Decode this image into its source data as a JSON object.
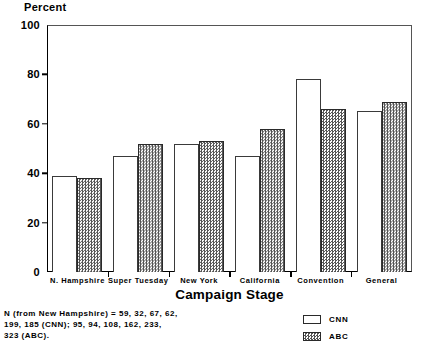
{
  "chart_data": {
    "type": "bar",
    "title": "",
    "ylabel": "Percent",
    "xlabel": "Campaign Stage",
    "ylim": [
      0,
      100
    ],
    "yticks": [
      0,
      20,
      40,
      60,
      80,
      100
    ],
    "grid": false,
    "legend_position": "bottom-right",
    "categories": [
      "N. Hampshire",
      "Super Tuesday",
      "New York",
      "California",
      "Convention",
      "General"
    ],
    "series": [
      {
        "name": "CNN",
        "values": [
          39,
          47,
          52,
          47,
          78,
          65
        ]
      },
      {
        "name": "ABC",
        "values": [
          38,
          52,
          53,
          58,
          66,
          69
        ]
      }
    ],
    "note": "N (from New Hampshire) = 59, 32, 67, 62,\n199, 185 (CNN); 95, 94, 108, 162, 233,\n323 (ABC)."
  },
  "legend": {
    "items": [
      {
        "label": "CNN",
        "swatch": "open-white"
      },
      {
        "label": "ABC",
        "swatch": "hatched-gray"
      }
    ]
  },
  "colors": {
    "cnn_fill": "#ffffff",
    "cnn_edge": "#3a3a3a",
    "abc_fill": "#808080",
    "abc_edge": "#2a2a2a",
    "axis": "#000000",
    "background": "#ffffff"
  }
}
